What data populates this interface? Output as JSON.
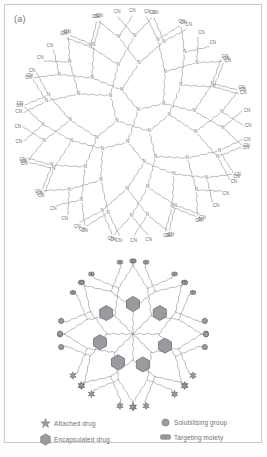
{
  "figure": {
    "background_color": "#ffffff",
    "frame_color": "#c9c9cf",
    "line_color": "#8d8d93",
    "marker_fill": "#9a9aa0",
    "marker_stroke": "#6d6d73",
    "text_color": "#6f6f74"
  },
  "panels": [
    {
      "id": "a",
      "label": "(a)",
      "description": "Poly(propylene imine) dendrimer skeleton with branching tertiary amine nodes and terminal nitrile groups",
      "branch_node_label": "N",
      "terminal_label": "CN",
      "generations": 4,
      "core_branches": 4,
      "terminal_count": 64
    },
    {
      "id": "b",
      "label": "(b)",
      "description": "Dendrimer decorated with attached drug, encapsulated drug, solubilising groups and targeting moieties",
      "core_branches": 8,
      "encapsulated_drug_count": 7,
      "solubilising_group_count": 20,
      "targeting_moiety_count": 11,
      "attached_drug_count": 14
    }
  ],
  "legend": {
    "items": [
      {
        "marker": "star-marker",
        "label": "Attached drug",
        "color": "#9a9aa0"
      },
      {
        "marker": "hexagon-marker",
        "label": "Encapsulated drug",
        "color": "#9a9aa0"
      },
      {
        "marker": "circle-marker",
        "label": "Solubilising group",
        "color": "#9a9aa0"
      },
      {
        "marker": "capsule-marker",
        "label": "Targeting moiety",
        "color": "#9a9aa0"
      }
    ]
  }
}
